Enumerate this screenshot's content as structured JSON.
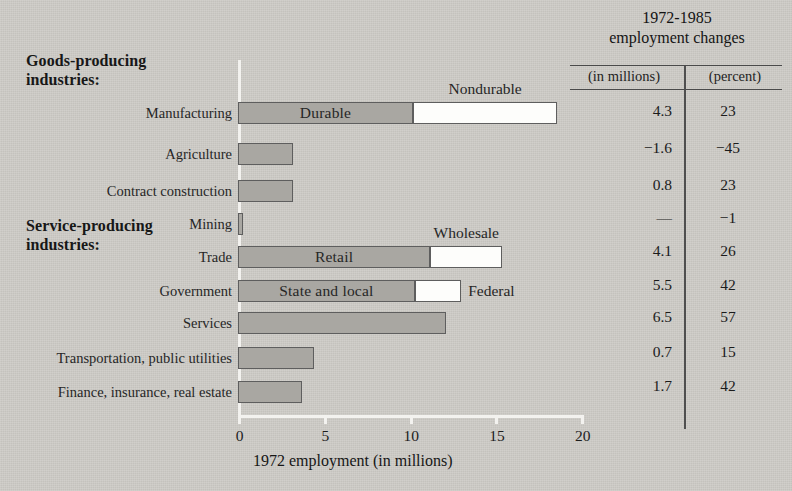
{
  "chart_data": {
    "type": "bar",
    "orientation": "horizontal",
    "title": "",
    "xlabel": "1972 employment (in millions)",
    "ylabel": "",
    "xlim": [
      0,
      20
    ],
    "xticks": [
      0,
      5,
      10,
      15,
      20
    ],
    "xticklabels": [
      "0",
      "5",
      "10",
      "15",
      "20"
    ],
    "grid": false,
    "legend": "inline-segment-labels",
    "group_headings": [
      {
        "text": "Goods-producing\nindustries:",
        "applies_to": [
          "Manufacturing",
          "Agriculture",
          "Contract construction",
          "Mining"
        ]
      },
      {
        "text": "Service-producing\nindustries:",
        "applies_to": [
          "Trade",
          "Government",
          "Services",
          "Transportation, public utilities",
          "Finance, insurance, real estate"
        ]
      }
    ],
    "categories": [
      "Manufacturing",
      "Agriculture",
      "Contract construction",
      "Mining",
      "Trade",
      "Government",
      "Services",
      "Transportation, public utilities",
      "Finance, insurance, real estate"
    ],
    "values": [
      18.6,
      3.2,
      3.2,
      0.3,
      15.4,
      13.0,
      12.1,
      4.4,
      3.7
    ],
    "stacked_segments": {
      "Manufacturing": [
        {
          "label": "Durable",
          "value": 10.2,
          "style": "filled",
          "label_position": "inside"
        },
        {
          "label": "Nondurable",
          "value": 8.4,
          "style": "open",
          "label_position": "above"
        }
      ],
      "Trade": [
        {
          "label": "Retail",
          "value": 11.2,
          "style": "filled",
          "label_position": "inside"
        },
        {
          "label": "Wholesale",
          "value": 4.2,
          "style": "open",
          "label_position": "above"
        }
      ],
      "Government": [
        {
          "label": "State and local",
          "value": 10.3,
          "style": "filled",
          "label_position": "inside"
        },
        {
          "label": "Federal",
          "value": 2.7,
          "style": "open",
          "label_position": "right"
        }
      ]
    },
    "series": [
      {
        "name": "1972 employment (in millions)",
        "values": [
          18.6,
          3.2,
          3.2,
          0.3,
          15.4,
          13.0,
          12.1,
          4.4,
          3.7
        ]
      }
    ]
  },
  "groups": {
    "goods": "Goods-producing\nindustries:",
    "services": "Service-producing\nindustries:"
  },
  "bars": [
    {
      "label": "Manufacturing",
      "total": 18.6,
      "fill": 10.2,
      "fill_label": "Durable",
      "open_label": "Nondurable",
      "open_label_pos": "above"
    },
    {
      "label": "Agriculture",
      "total": 3.2,
      "fill": 3.2,
      "fill_label": "",
      "open_label": "",
      "open_label_pos": ""
    },
    {
      "label": "Contract construction",
      "total": 3.2,
      "fill": 3.2,
      "fill_label": "",
      "open_label": "",
      "open_label_pos": ""
    },
    {
      "label": "Mining",
      "total": 0.3,
      "fill": 0.3,
      "fill_label": "",
      "open_label": "",
      "open_label_pos": ""
    },
    {
      "label": "Trade",
      "total": 15.4,
      "fill": 11.2,
      "fill_label": "Retail",
      "open_label": "Wholesale",
      "open_label_pos": "above"
    },
    {
      "label": "Government",
      "total": 13.0,
      "fill": 10.3,
      "fill_label": "State and local",
      "open_label": "Federal",
      "open_label_pos": "right"
    },
    {
      "label": "Services",
      "total": 12.1,
      "fill": 12.1,
      "fill_label": "",
      "open_label": "",
      "open_label_pos": ""
    },
    {
      "label": "Transportation, public utilities",
      "total": 4.4,
      "fill": 4.4,
      "fill_label": "",
      "open_label": "",
      "open_label_pos": ""
    },
    {
      "label": "Finance, insurance, real estate",
      "total": 3.7,
      "fill": 3.7,
      "fill_label": "",
      "open_label": "",
      "open_label_pos": ""
    }
  ],
  "axis": {
    "title": "1972 employment (in millions)",
    "ticklabels": [
      "0",
      "5",
      "10",
      "15",
      "20"
    ]
  },
  "table": {
    "title": "1972-1985\nemployment changes",
    "columns": [
      "(in millions)",
      "(percent)"
    ],
    "rows": [
      {
        "millions": "4.3",
        "percent": "23"
      },
      {
        "millions": "−1.6",
        "percent": "−45"
      },
      {
        "millions": "0.8",
        "percent": "23"
      },
      {
        "millions": "—",
        "percent": "−1"
      },
      {
        "millions": "4.1",
        "percent": "26"
      },
      {
        "millions": "5.5",
        "percent": "42"
      },
      {
        "millions": "6.5",
        "percent": "57"
      },
      {
        "millions": "0.7",
        "percent": "15"
      },
      {
        "millions": "1.7",
        "percent": "42"
      }
    ]
  },
  "colors": {
    "background": "#cdcbc6",
    "bar_fill": "#a9a7a2",
    "bar_open": "#fdfdfb",
    "bar_border": "#5e5e5e",
    "axis": "#f3f2ef",
    "text": "#1b1b1b"
  }
}
